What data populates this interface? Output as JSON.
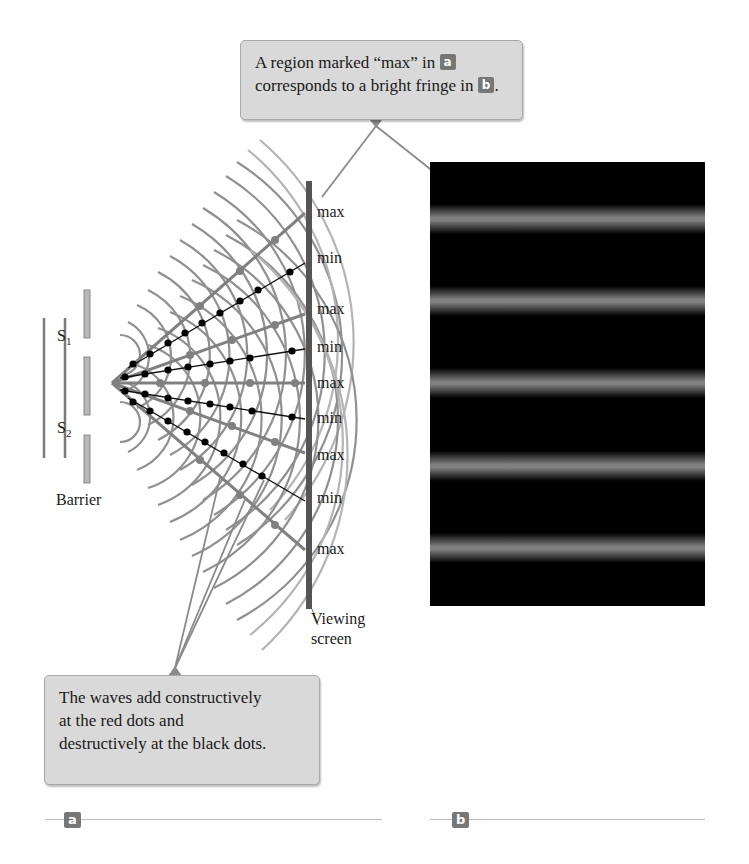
{
  "top_callout": {
    "line1": "A region marked “max” in",
    "badge1": "a",
    "line2": "corresponds to a bright fringe in",
    "badge2": "b",
    "suffix": "."
  },
  "bottom_callout": {
    "text_lines": [
      "The waves add constructively",
      "at the red dots and",
      "destructively at the black dots."
    ]
  },
  "panel_a": {
    "sources": [
      "S1",
      "S2"
    ],
    "barrier_label": "Barrier",
    "screen_label_line1": "Viewing",
    "screen_label_line2": "screen",
    "screen_labels": [
      "max",
      "min",
      "max",
      "min",
      "max",
      "min",
      "max",
      "min",
      "max"
    ]
  },
  "panel_b": {
    "bright_fringe_count": 5
  },
  "panel_labels": {
    "a": "a",
    "b": "b"
  },
  "colors": {
    "callout_bg": "#d9d9d9",
    "wave_line": "#8a8a8a",
    "wave_light": "#bdbdbd",
    "min_dots": "#000000",
    "fringe_bg": "#000000",
    "badge_bg": "#777777"
  }
}
